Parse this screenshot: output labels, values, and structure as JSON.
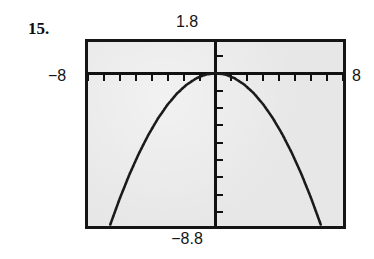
{
  "exercise": {
    "number_label": "15."
  },
  "calculator": {
    "window_labels": {
      "ymax": "1.8",
      "ymin": "−8.8",
      "xmin": "−8",
      "xmax": "8"
    },
    "screen": {
      "background_color": "#e7e7e7",
      "border_color": "#151515",
      "curve_color": "#1a1a1a"
    }
  },
  "chart_data": {
    "type": "line",
    "title": "",
    "subtitle": "",
    "xlabel": "",
    "ylabel": "",
    "xlim": [
      -8,
      8
    ],
    "ylim": [
      -8.8,
      1.8
    ],
    "xscl": 1,
    "yscl": 1,
    "grid": false,
    "legend": null,
    "axes": {
      "x_axis_at_y": 0,
      "y_axis_at_x": 0,
      "tick_marks": true,
      "x_tick_count": 16,
      "y_tick_count": 10
    },
    "annotations": [
      {
        "text": "1.8",
        "position": "above-screen-top-center"
      },
      {
        "text": "−8.8",
        "position": "below-screen-bottom-center"
      },
      {
        "text": "−8",
        "position": "left-of-screen-at-x-axis"
      },
      {
        "text": "8",
        "position": "right-of-screen-at-x-axis"
      }
    ],
    "series": [
      {
        "name": "downward parabola",
        "style": "dotted",
        "x": [
          -6.6,
          -6.0,
          -5.4,
          -4.8,
          -4.2,
          -3.6,
          -3.0,
          -2.4,
          -1.8,
          -1.2,
          -0.6,
          0.0,
          0.6,
          1.2,
          1.8,
          2.4,
          3.0,
          3.6,
          4.2,
          4.8,
          5.4,
          6.0,
          6.6
        ],
        "y": [
          -8.71,
          -7.2,
          -5.83,
          -4.61,
          -3.53,
          -2.59,
          -1.8,
          -1.15,
          -0.65,
          -0.29,
          -0.07,
          0.0,
          -0.07,
          -0.29,
          -0.65,
          -1.15,
          -1.8,
          -2.59,
          -3.53,
          -4.61,
          -5.83,
          -7.2,
          -8.71
        ]
      }
    ]
  }
}
